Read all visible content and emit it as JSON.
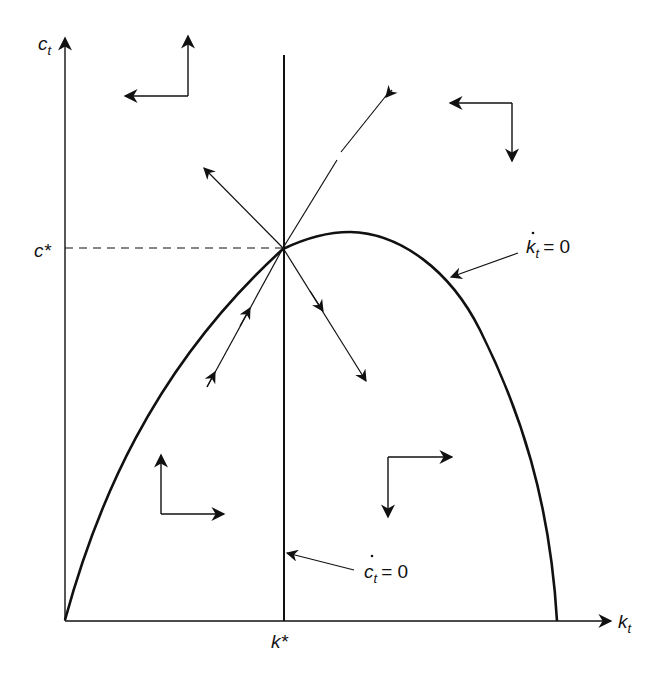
{
  "diagram": {
    "type": "phase-diagram",
    "axes": {
      "y_label": "c",
      "y_label_sub": "t",
      "x_label": "k",
      "x_label_sub": "t"
    },
    "steady_state": {
      "c_label": "c*",
      "k_label": "k*"
    },
    "loci": {
      "k_dot": {
        "var": "k",
        "sub": "t",
        "eq": "= 0"
      },
      "c_dot": {
        "var": "c",
        "sub": "t",
        "eq": "= 0"
      }
    },
    "direction_arrows": [
      {
        "region": "top-left",
        "horizontal": "left",
        "vertical": "up"
      },
      {
        "region": "top-right",
        "horizontal": "left",
        "vertical": "down"
      },
      {
        "region": "bottom-left",
        "horizontal": "right",
        "vertical": "up"
      },
      {
        "region": "bottom-right",
        "horizontal": "right",
        "vertical": "down"
      }
    ],
    "trajectories": [
      {
        "name": "saddle-path-lower",
        "direction": "toward-steady-state"
      },
      {
        "name": "saddle-path-upper",
        "direction": "toward-steady-state"
      },
      {
        "name": "unstable-upper-left",
        "direction": "away-from-steady-state"
      },
      {
        "name": "unstable-lower-right",
        "direction": "away-from-steady-state"
      }
    ],
    "colors": {
      "ink": "#111111",
      "background": "#ffffff"
    }
  }
}
